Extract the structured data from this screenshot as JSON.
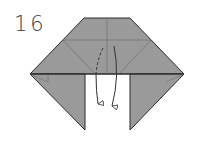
{
  "diagram": {
    "step_number": "16",
    "colors": {
      "paper_fill": "#9a9a9a",
      "outline": "#2a2a2a",
      "crease": "#6e6e6e",
      "arrow": "#333333",
      "background": "#ffffff"
    },
    "arrows": [
      {
        "name": "valley-fold-arrow",
        "style": "dashed-to-solid",
        "direction": "down"
      },
      {
        "name": "fold-down-arrow",
        "style": "solid",
        "direction": "down"
      }
    ]
  }
}
